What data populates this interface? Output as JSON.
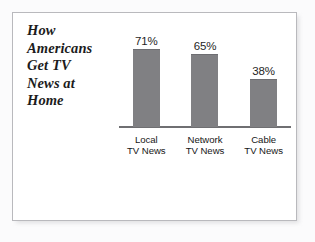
{
  "chart_data": {
    "type": "bar",
    "title": "How Americans Get TV News at Home",
    "title_lines": "How\nAmericans\nGet TV\nNews at\nHome",
    "categories": [
      "Local TV News",
      "Network TV News",
      "Cable TV News"
    ],
    "category_lines": [
      "Local\nTV News",
      "Network\nTV News",
      "Cable\nTV News"
    ],
    "values": [
      71,
      65,
      38
    ],
    "value_labels": [
      "71%",
      "65%",
      "38%"
    ],
    "xlabel": "",
    "ylabel": "",
    "ylim": [
      0,
      100
    ],
    "grid": false,
    "legend": false,
    "units": "percent",
    "bar_color": "#808083",
    "axis_color": "#6f6f72",
    "text_color": "#1a1a1a",
    "background": "#ffffff"
  },
  "bars": [
    {
      "value_label": "71%",
      "cat_label": "Local\nTV News",
      "height_pct": 71
    },
    {
      "value_label": "65%",
      "cat_label": "Network\nTV News",
      "height_pct": 65
    },
    {
      "value_label": "38%",
      "cat_label": "Cable\nTV News",
      "height_pct": 38
    }
  ]
}
